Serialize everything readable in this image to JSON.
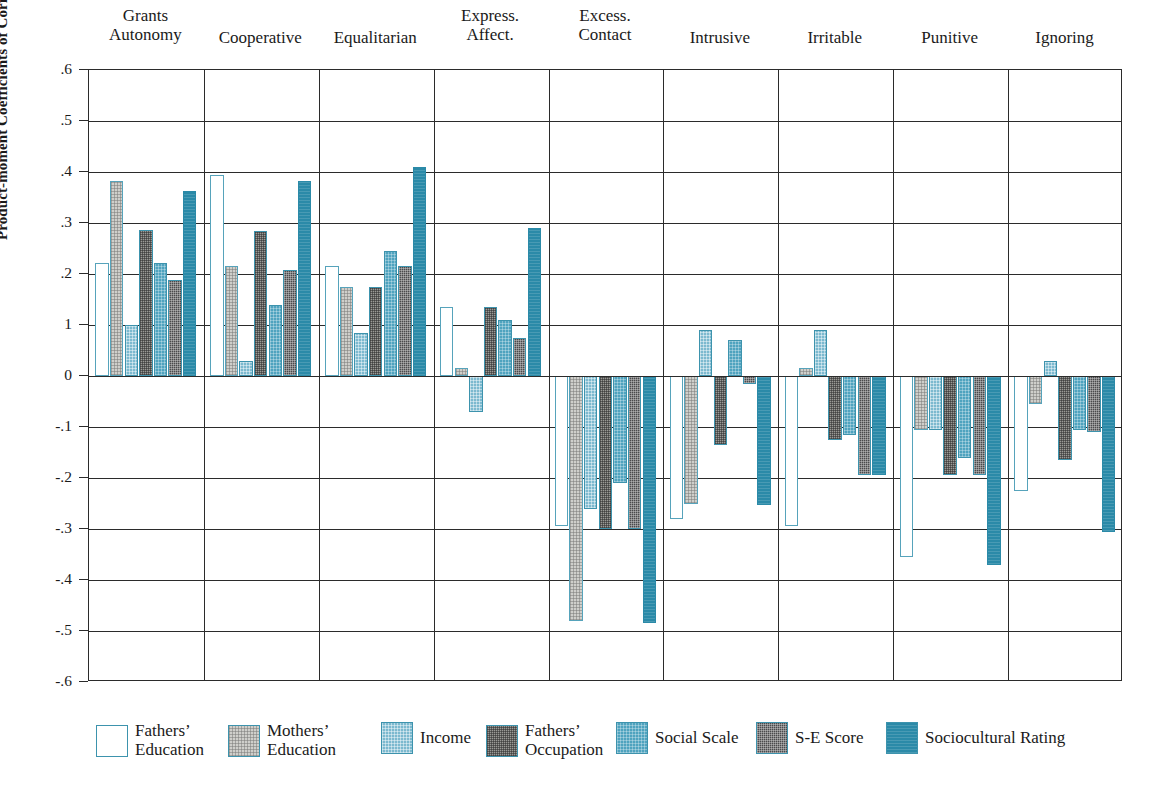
{
  "chart_data": {
    "type": "bar",
    "title": "",
    "xlabel": "",
    "ylabel": "Product-moment Coefficients of Correlation",
    "ylim": [
      -0.6,
      0.6
    ],
    "grid": true,
    "legend_position": "bottom",
    "ytick_labels": [
      ".6",
      ".5",
      ".4",
      ".3",
      ".2",
      "1",
      "0",
      "-.1",
      "-.2",
      "-.3",
      "-.4",
      "-.5",
      "-.6"
    ],
    "ytick_values": [
      0.6,
      0.5,
      0.4,
      0.3,
      0.2,
      0.1,
      0,
      -0.1,
      -0.2,
      -0.3,
      -0.4,
      -0.5,
      -0.6
    ],
    "categories": [
      "Grants\nAutonomy",
      "Cooperative",
      "Equalitarian",
      "Express.\nAffect.",
      "Excess.\nContact",
      "Intrusive",
      "Irritable",
      "Punitive",
      "Ignoring"
    ],
    "series": [
      {
        "name": "Fathers’\nEducation",
        "key": "fathers-education",
        "color": "#ffffff",
        "border": "#56a3bb",
        "values": [
          0.222,
          0.395,
          0.215,
          0.135,
          -0.295,
          -0.28,
          -0.295,
          -0.355,
          -0.225
        ]
      },
      {
        "name": "Mothers’\nEducation",
        "key": "mothers-education",
        "color": "#cfcfcb",
        "border": "#56a3bb",
        "values": [
          0.382,
          0.215,
          0.175,
          0.015,
          -0.48,
          -0.25,
          0.015,
          -0.105,
          -0.055
        ]
      },
      {
        "name": "Income",
        "key": "income",
        "color": "#7cb9cf",
        "border": "#3d93ad",
        "values": [
          0.1,
          0.03,
          0.085,
          -0.07,
          -0.26,
          0.09,
          0.09,
          -0.105,
          0.03
        ]
      },
      {
        "name": "Fathers’\nOccupation",
        "key": "fathers-occupation",
        "color": "#9a9a96",
        "border": "#3d93ad",
        "values": [
          0.287,
          0.285,
          0.175,
          0.135,
          -0.3,
          -0.135,
          -0.125,
          -0.195,
          -0.165
        ]
      },
      {
        "name": "Social Scale",
        "key": "social-scale",
        "color": "#4fa3bf",
        "border": "#3d93ad",
        "values": [
          0.222,
          0.14,
          0.245,
          0.11,
          -0.21,
          0.07,
          -0.115,
          -0.16,
          -0.105
        ]
      },
      {
        "name": "S-E Score",
        "key": "se-score",
        "color": "#4a4a4c",
        "border": "#3d93ad",
        "values": [
          0.188,
          0.208,
          0.215,
          0.075,
          -0.3,
          -0.015,
          -0.195,
          -0.195,
          -0.11
        ]
      },
      {
        "name": "Sociocultural Rating",
        "key": "sociocultural-rating",
        "color": "#2b8aa8",
        "border": "#2b8aa8",
        "values": [
          0.363,
          0.382,
          0.41,
          0.29,
          -0.485,
          -0.252,
          -0.195,
          -0.37,
          -0.305
        ]
      }
    ]
  },
  "axis": {
    "y_title": "Product-moment Coefficients of Correlation"
  }
}
